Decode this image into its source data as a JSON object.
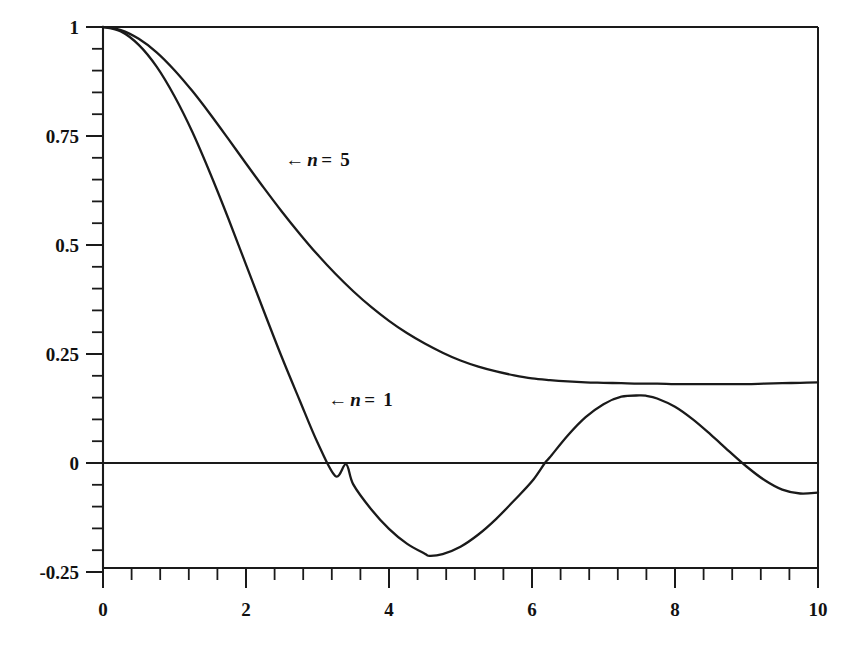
{
  "chart_data": {
    "type": "line",
    "title": "",
    "subtitle": "",
    "xlabel": "",
    "ylabel": "",
    "xlim": [
      0,
      10
    ],
    "ylim": [
      -0.25,
      1
    ],
    "grid": false,
    "legend_position": "inline-annotations",
    "x_ticks": [
      "0",
      "2",
      "4",
      "6",
      "8",
      "10"
    ],
    "x_tick_values": [
      0,
      2,
      4,
      6,
      8,
      10
    ],
    "x_minor_interval": 0.4,
    "y_ticks": [
      "1",
      "0.75",
      "0.5",
      "0.25",
      "0",
      "-0.25"
    ],
    "y_tick_values": [
      1,
      0.75,
      0.5,
      0.25,
      0,
      -0.25
    ],
    "y_minor_interval": 0.05,
    "annotations": [
      {
        "text": "← n = 5",
        "arrow": "←",
        "symbol": "n",
        "equals": "=",
        "value": "5",
        "x": 2.55,
        "y": 0.695
      },
      {
        "text": "← n = 1",
        "arrow": "←",
        "symbol": "n",
        "equals": "=",
        "value": "1",
        "x": 3.15,
        "y": 0.145
      }
    ],
    "series": [
      {
        "name": "n = 5",
        "label": "n = 5",
        "color": "#1a1a1a",
        "x": [
          0,
          0.25,
          0.5,
          0.75,
          1,
          1.25,
          1.5,
          1.75,
          2,
          2.25,
          2.5,
          2.75,
          3,
          3.25,
          3.5,
          3.75,
          4,
          4.25,
          4.5,
          4.75,
          5,
          5.25,
          5.5,
          5.75,
          6,
          6.25,
          6.5,
          6.75,
          7,
          7.25,
          7.5,
          7.75,
          8,
          8.25,
          8.5,
          8.75,
          9,
          9.25,
          9.5,
          9.75,
          10
        ],
        "y": [
          1,
          0.993,
          0.973,
          0.942,
          0.901,
          0.853,
          0.8,
          0.744,
          0.687,
          0.631,
          0.577,
          0.526,
          0.478,
          0.434,
          0.394,
          0.358,
          0.326,
          0.298,
          0.274,
          0.253,
          0.235,
          0.221,
          0.21,
          0.201,
          0.194,
          0.19,
          0.187,
          0.185,
          0.184,
          0.183,
          0.182,
          0.182,
          0.181,
          0.181,
          0.181,
          0.181,
          0.181,
          0.182,
          0.183,
          0.184,
          0.185
        ]
      },
      {
        "name": "n = 1",
        "label": "n = 1",
        "color": "#1a1a1a",
        "x": [
          0,
          0.25,
          0.5,
          0.75,
          1,
          1.25,
          1.5,
          1.75,
          2,
          2.25,
          2.5,
          2.75,
          3,
          3.25,
          3.4,
          3.5,
          3.75,
          4,
          4.25,
          4.5,
          4.57,
          4.75,
          5,
          5.25,
          5.5,
          5.75,
          6,
          6.18,
          6.25,
          6.5,
          6.75,
          7,
          7.25,
          7.5,
          7.6,
          7.75,
          8,
          8.25,
          8.5,
          8.75,
          9,
          9.25,
          9.5,
          9.75,
          10
        ],
        "y": [
          1,
          0.99,
          0.959,
          0.909,
          0.841,
          0.759,
          0.664,
          0.562,
          0.455,
          0.348,
          0.243,
          0.144,
          0.047,
          -0.03,
          -0.003,
          -0.049,
          -0.106,
          -0.151,
          -0.185,
          -0.208,
          -0.213,
          -0.209,
          -0.192,
          -0.164,
          -0.128,
          -0.086,
          -0.042,
          0,
          0.013,
          0.063,
          0.105,
          0.135,
          0.152,
          0.155,
          0.154,
          0.148,
          0.129,
          0.1,
          0.065,
          0.028,
          -0.008,
          -0.039,
          -0.061,
          -0.07,
          -0.068
        ]
      }
    ],
    "zero_crossings_n1": [
      3.41,
      6.18,
      9.25
    ],
    "minimum_n1": {
      "x": 4.57,
      "y": -0.213
    },
    "maximum_n1_secondary": {
      "x": 7.6,
      "y": 0.155
    },
    "n5_right_value": 0.185
  }
}
